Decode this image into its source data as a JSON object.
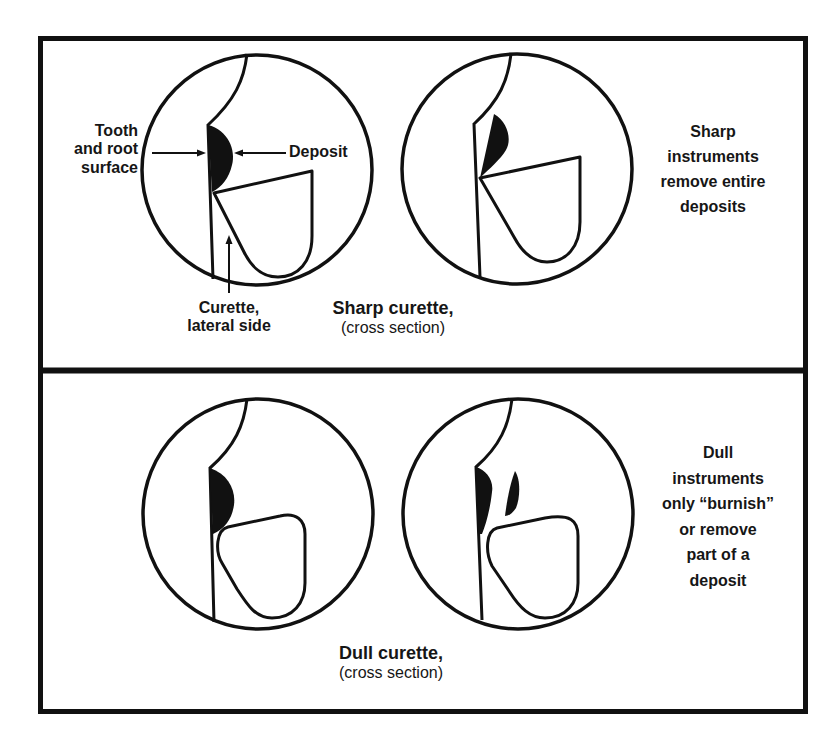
{
  "figure": {
    "top_panel": {
      "title": "Sharp curette,",
      "subtitle": "(cross section)",
      "note": [
        "Sharp",
        "instruments",
        "remove entire",
        "deposits"
      ],
      "labels": {
        "tooth": [
          "Tooth",
          "and root",
          "surface"
        ],
        "deposit": "Deposit",
        "curette": [
          "Curette,",
          "lateral side"
        ]
      }
    },
    "bottom_panel": {
      "title": "Dull curette,",
      "subtitle": "(cross section)",
      "note": [
        "Dull",
        "instruments",
        "only “burnish”",
        "or remove",
        "part of a",
        "deposit"
      ]
    },
    "colors": {
      "ink": "#111111",
      "background": "#ffffff"
    }
  }
}
